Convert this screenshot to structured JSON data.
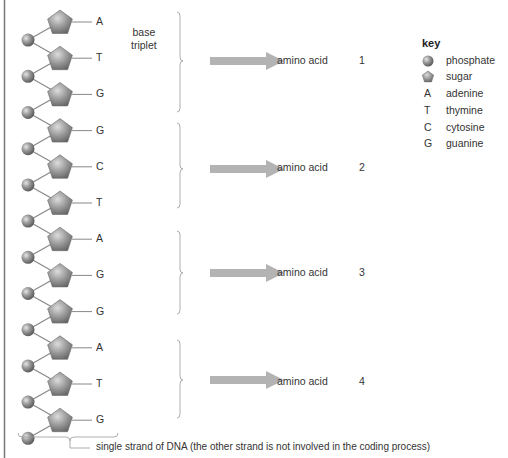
{
  "strand": {
    "bases": [
      "A",
      "T",
      "G",
      "G",
      "C",
      "T",
      "A",
      "G",
      "G",
      "A",
      "T",
      "G"
    ],
    "label": "single strand of DNA (the other strand is not involved in the coding process)"
  },
  "triplet_label": "base\ntriplet",
  "triplet_label_lines": [
    "base",
    "triplet"
  ],
  "triplets": [
    {
      "bases": [
        "A",
        "T",
        "G"
      ],
      "product": "amino acid",
      "number": "1"
    },
    {
      "bases": [
        "G",
        "C",
        "T"
      ],
      "product": "amino acid",
      "number": "2"
    },
    {
      "bases": [
        "A",
        "G",
        "G"
      ],
      "product": "amino acid",
      "number": "3"
    },
    {
      "bases": [
        "A",
        "T",
        "G"
      ],
      "product": "amino acid",
      "number": "4"
    }
  ],
  "key": {
    "title": "key",
    "items": [
      {
        "symbol": "phosphate-icon",
        "label": "phosphate"
      },
      {
        "symbol": "sugar-icon",
        "label": "sugar"
      },
      {
        "symbol": "A",
        "label": "adenine"
      },
      {
        "symbol": "T",
        "label": "thymine"
      },
      {
        "symbol": "C",
        "label": "cytosine"
      },
      {
        "symbol": "G",
        "label": "guanine"
      }
    ]
  },
  "colors": {
    "arrow": "#b3b3b3",
    "line": "#888888",
    "shape": "#999999",
    "text": "#333333"
  }
}
